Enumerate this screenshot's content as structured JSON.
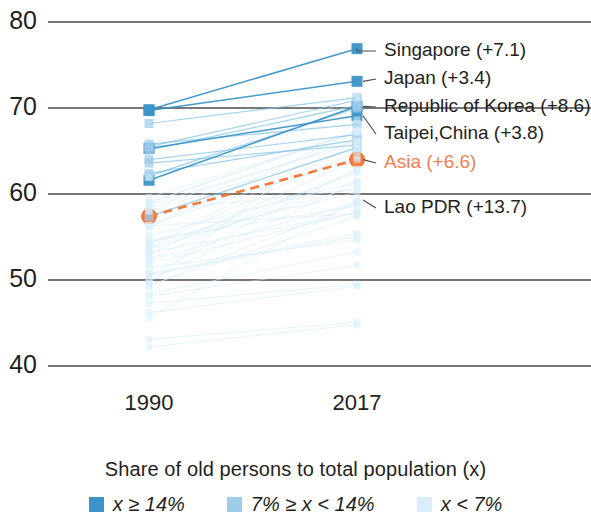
{
  "figure": {
    "legend_title": "Share of old persons to total population (x)"
  },
  "axes": {
    "y_ticks": [
      "80",
      "70",
      "60",
      "50",
      "40"
    ],
    "x_ticks": [
      "1990",
      "2017"
    ]
  },
  "legend": {
    "items": [
      {
        "name": "legend-high",
        "label": "x ≥ 14%",
        "color": "#3c93c8"
      },
      {
        "name": "legend-mid",
        "label": "7% ≥ x < 14%",
        "color": "#9ecce9"
      },
      {
        "name": "legend-low",
        "label": "x < 7%",
        "color": "#d9eefa"
      }
    ]
  },
  "annotations": [
    {
      "name": "singapore",
      "label": "Singapore (+7.1)",
      "color": "#231f20"
    },
    {
      "name": "japan",
      "label": "Japan (+3.4)",
      "color": "#231f20"
    },
    {
      "name": "republic-of-korea",
      "label": "Republic of Korea (+8.6)",
      "color": "#231f20"
    },
    {
      "name": "taipei-china",
      "label": "Taipei,China (+3.8)",
      "color": "#231f20"
    },
    {
      "name": "asia",
      "label": "Asia (+6.6)",
      "color": "#f07f52"
    },
    {
      "name": "lao-pdr",
      "label": "Lao PDR (+13.7)",
      "color": "#231f20"
    }
  ],
  "chart_data": {
    "type": "line",
    "subtype": "slopegraph",
    "title": "",
    "subtitle": "",
    "xlabel": "",
    "ylabel": "",
    "legend_title": "Share of old persons to total population (x)",
    "x": [
      "1990",
      "2017"
    ],
    "ylim": [
      38,
      81
    ],
    "y_ticks": [
      40,
      50,
      60,
      70,
      80
    ],
    "grid": "horizontal",
    "legend_position": "bottom-center",
    "highlight_color": "#f4793b",
    "series": [
      {
        "name": "Singapore",
        "change": 7.1,
        "values": [
          69.8,
          76.9
        ],
        "group": "x>=14%",
        "labeled": true
      },
      {
        "name": "Japan",
        "change": 3.4,
        "values": [
          69.7,
          73.1
        ],
        "group": "x>=14%",
        "labeled": true
      },
      {
        "name": "Republic of Korea",
        "change": 8.6,
        "values": [
          61.6,
          70.2
        ],
        "group": "x>=14%",
        "labeled": true
      },
      {
        "name": "Taipei,China",
        "change": 3.8,
        "values": [
          65.3,
          69.1
        ],
        "group": "x>=14%",
        "labeled": true
      },
      {
        "name": "Asia",
        "change": 6.6,
        "values": [
          57.4,
          64.0
        ],
        "group": "aggregate",
        "labeled": true
      },
      {
        "name": "Lao PDR",
        "change": 13.7,
        "values": [
          45.6,
          59.3
        ],
        "group": "x<7%",
        "labeled": true
      },
      {
        "name": "Hong Kong, China",
        "change": 3.0,
        "values": [
          68.2,
          71.2
        ],
        "group": "7%>=x<14%",
        "labeled": false
      },
      {
        "name": "Thailand",
        "change": 5.4,
        "values": [
          65.5,
          70.9
        ],
        "group": "7%>=x<14%",
        "labeled": false
      },
      {
        "name": "China",
        "change": 5.2,
        "values": [
          65.1,
          70.3
        ],
        "group": "7%>=x<14%",
        "labeled": false
      },
      {
        "name": "Armenia",
        "change": 2.3,
        "values": [
          65.8,
          68.1
        ],
        "group": "7%>=x<14%",
        "labeled": false
      },
      {
        "name": "Georgia",
        "change": 2.9,
        "values": [
          64.0,
          66.9
        ],
        "group": "7%>=x<14%",
        "labeled": false
      },
      {
        "name": "Sri Lanka",
        "change": 3.9,
        "values": [
          62.4,
          66.3
        ],
        "group": "7%>=x<14%",
        "labeled": false
      },
      {
        "name": "Kazakhstan",
        "change": 2.1,
        "values": [
          63.6,
          65.7
        ],
        "group": "7%>=x<14%",
        "labeled": false
      },
      {
        "name": "Viet Nam",
        "change": 8.0,
        "values": [
          57.4,
          65.4
        ],
        "group": "7%>=x<14%",
        "labeled": false
      },
      {
        "name": "Azerbaijan",
        "change": 7.9,
        "values": [
          62.1,
          70.0
        ],
        "group": "7%>=x<14%",
        "labeled": false
      },
      {
        "name": "Myanmar",
        "change": 8.2,
        "values": [
          59.0,
          67.2
        ],
        "group": "x<7%",
        "labeled": false
      },
      {
        "name": "Indonesia",
        "change": 7.6,
        "values": [
          59.6,
          67.2
        ],
        "group": "x<7%",
        "labeled": false
      },
      {
        "name": "Malaysia",
        "change": 8.4,
        "values": [
          59.0,
          67.4
        ],
        "group": "x<7%",
        "labeled": false
      },
      {
        "name": "Bangladesh",
        "change": 11.6,
        "values": [
          54.2,
          65.8
        ],
        "group": "x<7%",
        "labeled": false
      },
      {
        "name": "India",
        "change": 7.8,
        "values": [
          58.4,
          66.2
        ],
        "group": "x<7%",
        "labeled": false
      },
      {
        "name": "Nepal",
        "change": 8.8,
        "values": [
          53.7,
          62.5
        ],
        "group": "x<7%",
        "labeled": false
      },
      {
        "name": "Cambodia",
        "change": 12.3,
        "values": [
          50.6,
          62.9
        ],
        "group": "x<7%",
        "labeled": false
      },
      {
        "name": "Philippines",
        "change": 7.9,
        "values": [
          56.4,
          64.3
        ],
        "group": "x<7%",
        "labeled": false
      },
      {
        "name": "Mongolia",
        "change": 11.1,
        "values": [
          53.9,
          65.0
        ],
        "group": "x<7%",
        "labeled": false
      },
      {
        "name": "Bhutan",
        "change": 11.2,
        "values": [
          56.1,
          67.3
        ],
        "group": "x<7%",
        "labeled": false
      },
      {
        "name": "Uzbekistan",
        "change": 11.0,
        "values": [
          53.0,
          64.0
        ],
        "group": "x<7%",
        "labeled": false
      },
      {
        "name": "Kyrgyz Republic",
        "change": 7.3,
        "values": [
          53.6,
          60.9
        ],
        "group": "x<7%",
        "labeled": false
      },
      {
        "name": "Tajikistan",
        "change": 8.0,
        "values": [
          49.4,
          57.4
        ],
        "group": "x<7%",
        "labeled": false
      },
      {
        "name": "Pakistan",
        "change": 4.5,
        "values": [
          50.6,
          55.1
        ],
        "group": "x<7%",
        "labeled": false
      },
      {
        "name": "Afghanistan",
        "change": 3.6,
        "values": [
          48.1,
          51.7
        ],
        "group": "x<7%",
        "labeled": false
      },
      {
        "name": "Papua New Guinea",
        "change": 6.2,
        "values": [
          55.2,
          61.4
        ],
        "group": "x<7%",
        "labeled": false
      },
      {
        "name": "Timor-Leste",
        "change": 4.9,
        "values": [
          48.4,
          53.3
        ],
        "group": "x<7%",
        "labeled": false
      },
      {
        "name": "Solomon Islands",
        "change": 6.0,
        "values": [
          51.9,
          57.9
        ],
        "group": "x<7%",
        "labeled": false
      },
      {
        "name": "Vanuatu",
        "change": 6.7,
        "values": [
          52.3,
          59.0
        ],
        "group": "x<7%",
        "labeled": false
      },
      {
        "name": "Samoa",
        "change": 4.7,
        "values": [
          50.7,
          55.4
        ],
        "group": "x<7%",
        "labeled": false
      },
      {
        "name": "Maldives",
        "change": 19.0,
        "values": [
          49.6,
          68.6
        ],
        "group": "x<7%",
        "labeled": false
      },
      {
        "name": "Fiji",
        "change": 7.1,
        "values": [
          58.8,
          65.9
        ],
        "group": "x<7%",
        "labeled": false
      },
      {
        "name": "Tonga",
        "change": 3.3,
        "values": [
          51.4,
          54.7
        ],
        "group": "x<7%",
        "labeled": false
      },
      {
        "name": "Kiribati",
        "change": 5.8,
        "values": [
          54.4,
          60.2
        ],
        "group": "x<7%",
        "labeled": false
      },
      {
        "name": "Marshall Islands",
        "change": 11.5,
        "values": [
          49.9,
          61.4
        ],
        "group": "x<7%",
        "labeled": false
      },
      {
        "name": "Turkmenistan",
        "change": 10.4,
        "values": [
          52.4,
          62.8
        ],
        "group": "x<7%",
        "labeled": false
      },
      {
        "name": "Brunei Darussalam",
        "change": 9.3,
        "values": [
          61.9,
          71.2
        ],
        "group": "x<7%",
        "labeled": false
      },
      {
        "name": "Micronesia",
        "change": 9.6,
        "values": [
          49.3,
          58.9
        ],
        "group": "x<7%",
        "labeled": false
      },
      {
        "name": "Palau",
        "change": 7.2,
        "values": [
          58.1,
          65.3
        ],
        "group": "x<7%",
        "labeled": false
      },
      {
        "name": "Nauru",
        "change": 4.6,
        "values": [
          53.2,
          57.8
        ],
        "group": "x<7%",
        "labeled": false
      },
      {
        "name": "Tuvalu",
        "change": 4.0,
        "values": [
          54.6,
          58.6
        ],
        "group": "x<7%",
        "labeled": false
      },
      {
        "name": "Cook Islands",
        "change": 2.5,
        "values": [
          58.0,
          60.5
        ],
        "group": "x<7%",
        "labeled": false
      },
      {
        "name": "Niue",
        "change": 1.4,
        "values": [
          56.3,
          57.7
        ],
        "group": "x<7%",
        "labeled": false
      },
      {
        "name": "Other A",
        "change": 2.0,
        "values": [
          43.1,
          45.1
        ],
        "group": "x<7%",
        "labeled": false
      },
      {
        "name": "Other B",
        "change": 2.6,
        "values": [
          42.2,
          44.8
        ],
        "group": "x<7%",
        "labeled": false
      },
      {
        "name": "Other C",
        "change": 3.1,
        "values": [
          46.2,
          49.3
        ],
        "group": "x<7%",
        "labeled": false
      },
      {
        "name": "Other D",
        "change": 2.2,
        "values": [
          47.3,
          49.5
        ],
        "group": "x<7%",
        "labeled": false
      }
    ]
  }
}
